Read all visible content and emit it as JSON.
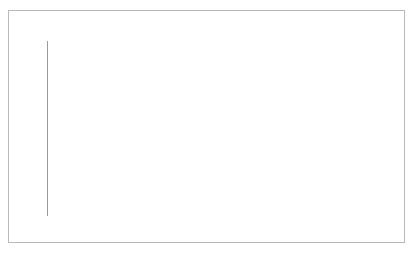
{
  "chart_data": {
    "type": "area",
    "xlabel": "",
    "ylabel": "",
    "categories": [
      "2000",
      "2001",
      "2002",
      "2003",
      "2004",
      "2005",
      "2006",
      "2007",
      "2008",
      "2009",
      "2010"
    ],
    "x": [
      2000,
      2001,
      2002,
      2003,
      2004,
      2005,
      2006,
      2007,
      2008,
      2009,
      2010
    ],
    "values": [
      50,
      51,
      52.5,
      54.5,
      56.5,
      58.5,
      61,
      63.5,
      67,
      68.5,
      70
    ],
    "series": [
      {
        "name": "Generics market share",
        "values": [
          50,
          51,
          52.5,
          54.5,
          56.5,
          58.5,
          61,
          63.5,
          67,
          68.5,
          70
        ]
      }
    ],
    "ylim": [
      0,
      100
    ],
    "ytick_labels": [
      "0",
      "10",
      "20",
      "30",
      "40",
      "50",
      "60",
      "70",
      "80",
      "90",
      "100"
    ],
    "yticks": [
      0,
      10,
      20,
      30,
      40,
      50,
      60,
      70,
      80,
      90,
      100
    ],
    "xtick_labels": [
      "2000",
      "2001",
      "2002",
      "2003",
      "2004",
      "2005",
      "2006",
      "2007",
      "2008",
      "2009",
      "2010"
    ],
    "grid": true,
    "grid_axis": "y",
    "legend": false,
    "legend_position": "none",
    "colors": {
      "area_fill": "#b3b3b3",
      "area_line": "#9e9e9e",
      "gridline": "#d4d4d4",
      "gridline_over_fill": "#8a8a8a",
      "axis": "#9a9a9a",
      "text": "#111111",
      "frame": "#b9b9b9",
      "background": "#ffffff"
    }
  }
}
